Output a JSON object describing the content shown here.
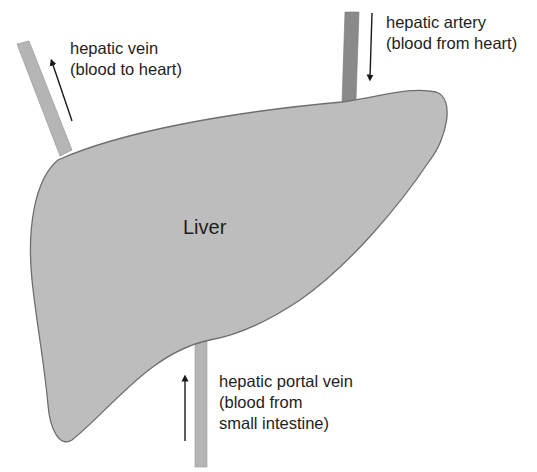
{
  "diagram": {
    "organ": {
      "label": "Liver",
      "fill": "#bdbdbd",
      "outline": "#6e6e6e"
    },
    "vessels": [
      {
        "id": "hepatic-vein",
        "name": "hepatic vein",
        "description": "(blood to heart)",
        "flow": "away from liver (upward)",
        "color": "#b5b5b5"
      },
      {
        "id": "hepatic-artery",
        "name": "hepatic artery",
        "description": "(blood from heart)",
        "flow": "into liver (downward)",
        "color": "#8a8a8a"
      },
      {
        "id": "hepatic-portal-vein",
        "name": "hepatic portal vein",
        "description_lines": [
          "(blood from",
          "small intestine)"
        ],
        "flow": "into liver (upward)",
        "color": "#b5b5b5"
      }
    ],
    "arrow_color": "#1a1a1a"
  }
}
